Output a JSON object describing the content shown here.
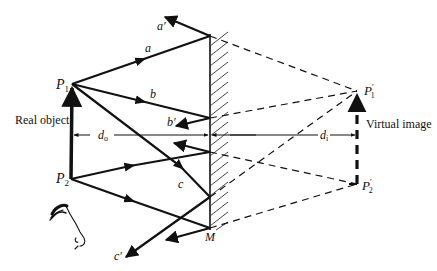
{
  "diagram": {
    "labels": {
      "a_prime": "a′",
      "a": "a",
      "p1": "P",
      "p1_sub": "1",
      "b": "b",
      "b_prime": "b′",
      "real_object": "Real object",
      "d_o": "d",
      "d_o_sub": "o",
      "c": "c",
      "p2": "P",
      "p2_sub": "2",
      "c_prime": "c′",
      "m": "M",
      "p1_image": "P",
      "p1_image_sub": "1",
      "p1_image_prime": "′",
      "virtual_image": "Virtual image",
      "d_i": "d",
      "d_i_sub": "i",
      "p2_image": "P",
      "p2_image_sub": "2",
      "p2_image_prime": "′"
    },
    "points": {
      "P1": [
        72,
        84
      ],
      "P2": [
        71,
        179
      ],
      "P1_image": [
        357,
        91
      ],
      "P2_image": [
        357,
        184
      ],
      "mirror_top": [
        210,
        36
      ],
      "mirror_bottom": [
        210,
        228
      ]
    },
    "rays": [
      {
        "name": "a",
        "from": "P1",
        "hit": [
          210,
          36
        ],
        "reflect_to": [
          163,
          17
        ]
      },
      {
        "name": "b",
        "from": "P1",
        "hit": [
          210,
          118
        ],
        "reflect_to": [
          175,
          126
        ]
      },
      {
        "name": "c",
        "from": "P1",
        "hit": [
          210,
          197
        ],
        "reflect_to": [
          125,
          258
        ]
      },
      {
        "name": "p2-upper",
        "from": "P2",
        "hit": [
          210,
          152
        ],
        "reflect_to": [
          174,
          143
        ]
      },
      {
        "name": "p2-lower",
        "from": "P2",
        "hit": [
          210,
          228
        ],
        "reflect_to": [
          165,
          240
        ]
      }
    ],
    "colors": {
      "ink": "#111111",
      "background": "#ffffff"
    }
  }
}
